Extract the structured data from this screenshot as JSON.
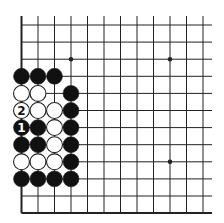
{
  "diagram": {
    "type": "go-board-fragment",
    "columns": 12,
    "rows": 12,
    "grid": {
      "x0": 21.5,
      "dx": 16.5,
      "y0": 25,
      "dy": 17.1,
      "line_top": 16,
      "line_right": 212,
      "bottom_edge_row": 11,
      "left_edge_col": 0
    },
    "colors": {
      "background": "#ffffff",
      "line": "#222222",
      "black_stone": "#111111",
      "white_stone": "#ffffff",
      "stone_outline": "#222222"
    },
    "star_points": [
      {
        "col": 3,
        "row": 2
      },
      {
        "col": 9,
        "row": 2
      },
      {
        "col": 9,
        "row": 8
      }
    ],
    "stones": [
      {
        "col": 0,
        "row": 3,
        "color": "black"
      },
      {
        "col": 1,
        "row": 3,
        "color": "black"
      },
      {
        "col": 2,
        "row": 3,
        "color": "black"
      },
      {
        "col": 0,
        "row": 4,
        "color": "white"
      },
      {
        "col": 1,
        "row": 4,
        "color": "white"
      },
      {
        "col": 3,
        "row": 4,
        "color": "black"
      },
      {
        "col": 0,
        "row": 5,
        "color": "white",
        "label": "2"
      },
      {
        "col": 1,
        "row": 5,
        "color": "white"
      },
      {
        "col": 2,
        "row": 5,
        "color": "white"
      },
      {
        "col": 3,
        "row": 5,
        "color": "black"
      },
      {
        "col": 0,
        "row": 6,
        "color": "black",
        "label": "1"
      },
      {
        "col": 1,
        "row": 6,
        "color": "black"
      },
      {
        "col": 2,
        "row": 6,
        "color": "white"
      },
      {
        "col": 3,
        "row": 6,
        "color": "black"
      },
      {
        "col": 0,
        "row": 7,
        "color": "black"
      },
      {
        "col": 1,
        "row": 7,
        "color": "black"
      },
      {
        "col": 2,
        "row": 7,
        "color": "white"
      },
      {
        "col": 3,
        "row": 7,
        "color": "black"
      },
      {
        "col": 0,
        "row": 8,
        "color": "white"
      },
      {
        "col": 1,
        "row": 8,
        "color": "white"
      },
      {
        "col": 2,
        "row": 8,
        "color": "white"
      },
      {
        "col": 3,
        "row": 8,
        "color": "black"
      },
      {
        "col": 0,
        "row": 9,
        "color": "black"
      },
      {
        "col": 1,
        "row": 9,
        "color": "black"
      },
      {
        "col": 2,
        "row": 9,
        "color": "black"
      },
      {
        "col": 3,
        "row": 9,
        "color": "black"
      }
    ],
    "move_labels": [
      "1",
      "2"
    ]
  }
}
